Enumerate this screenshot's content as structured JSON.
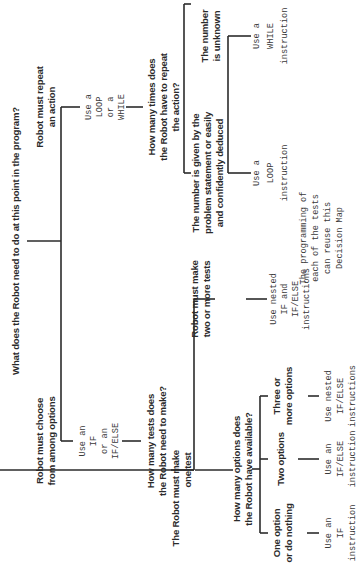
{
  "diagram": {
    "title": "Decision Map",
    "orientation": "rotated -90deg (text reads bottom-to-top)",
    "root": {
      "question": "What does the Robot need to do at this point in the program?"
    },
    "repeat_branch": {
      "label": [
        "Robot must repeat",
        "an action"
      ],
      "instruction": [
        "Use a",
        "LOOP",
        "or a",
        "WHILE"
      ],
      "question": [
        "How many times does",
        "the Robot have to repeat",
        "the action?"
      ],
      "known": {
        "label": [
          "The number is given by the",
          "problem statement or easily",
          "and confidently deduced"
        ],
        "instruction": [
          "Use a",
          "LOOP",
          "instruction"
        ]
      },
      "unknown": {
        "label": [
          "The number",
          "is unknown"
        ],
        "instruction": [
          "Use a",
          "WHILE",
          "instruction"
        ]
      }
    },
    "choose_branch": {
      "label": [
        "Robot must choose",
        "from among options"
      ],
      "instruction": [
        "Use an",
        "IF",
        "or an",
        "IF/ELSE"
      ],
      "question": [
        "How many tests does",
        "the Robot need to make?"
      ],
      "multi_test": {
        "label": [
          "Robot must make",
          "two or more tests"
        ],
        "instruction": [
          "Use nested",
          "IF and",
          "IF/ELSE",
          "instructions"
        ],
        "note": [
          "The programming of",
          "each of the tests",
          "can reuse this",
          "Decision Map"
        ]
      },
      "one_test": {
        "label": [
          "The Robot must make",
          "one test"
        ],
        "question": [
          "How many options does",
          "the Robot have available?"
        ],
        "options": [
          {
            "label": [
              "One option",
              "or do nothing"
            ],
            "instruction": [
              "Use an",
              "IF",
              "instruction"
            ]
          },
          {
            "label": [
              "Two options"
            ],
            "instruction": [
              "Use an",
              "IF/ELSE",
              "instruction"
            ]
          },
          {
            "label": [
              "Three or",
              "more options"
            ],
            "instruction": [
              "Use nested",
              "IF/ELSE",
              "instructions"
            ]
          }
        ]
      }
    }
  }
}
